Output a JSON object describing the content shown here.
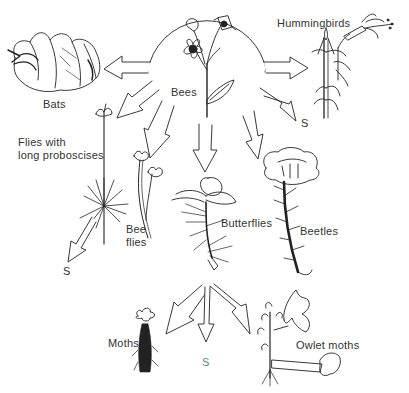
{
  "diagram": {
    "center": {
      "label": "Bees",
      "description": "ancestral bee-pollinated flower"
    },
    "pollinators": [
      {
        "id": "bats",
        "label": "Bats"
      },
      {
        "id": "hummingbirds",
        "label": "Hummingbirds"
      },
      {
        "id": "flies-long-proboscises",
        "label_line1": "Flies with",
        "label_line2": "long proboscises"
      },
      {
        "id": "bee-flies",
        "label_line1": "Bee",
        "label_line2": "flies"
      },
      {
        "id": "butterflies",
        "label": "Butterflies"
      },
      {
        "id": "beetles",
        "label": "Beetles"
      },
      {
        "id": "moths",
        "label": "Moths"
      },
      {
        "id": "owlet-moths",
        "label": "Owlet moths"
      }
    ],
    "self_pollination_markers": [
      {
        "position": "right-of-bees",
        "label": "S"
      },
      {
        "position": "below-flies",
        "label": "S"
      },
      {
        "position": "below-butterflies",
        "label": "S"
      }
    ],
    "colors": {
      "line": "#222222",
      "text": "#333333",
      "s_accent": "#4f8f83",
      "background": "#ffffff"
    }
  }
}
